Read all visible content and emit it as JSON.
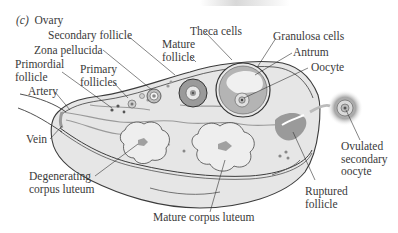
{
  "figure": {
    "panel_letter": "(c)",
    "title": "Ovary"
  },
  "labels": {
    "secondary_follicle": "Secondary follicle",
    "zona_pellucida": "Zona pellucida",
    "primordial_follicle": "Primordial\nfollicle",
    "primary_follicles": "Primary\nfollicles",
    "mature_follicle": "Mature\nfollicle",
    "theca_cells": "Theca cells",
    "granulosa_cells": "Granulosa cells",
    "antrum": "Antrum",
    "oocyte": "Oocyte",
    "artery": "Artery",
    "vein": "Vein",
    "degenerating_corpus_luteum": "Degenerating\ncorpus luteum",
    "mature_corpus_luteum": "Mature corpus luteum",
    "ruptured_follicle": "Ruptured\nfollicle",
    "ovulated_secondary_oocyte": "Ovulated\nsecondary\noocyte"
  },
  "colors": {
    "tissue": "#e4e4e4",
    "outline": "#3c3c3c",
    "dark_tissue": "#8a8a8a",
    "text": "#3a3a3a"
  }
}
